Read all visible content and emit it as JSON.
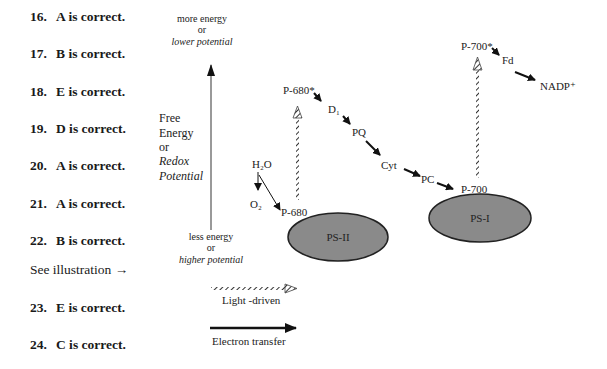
{
  "answers": [
    {
      "num": "16.",
      "text": "A is correct."
    },
    {
      "num": "17.",
      "text": "B is correct."
    },
    {
      "num": "18.",
      "text": "E is correct."
    },
    {
      "num": "19.",
      "text": "D is correct."
    },
    {
      "num": "20.",
      "text": "A is correct."
    },
    {
      "num": "21.",
      "text": "A is correct."
    },
    {
      "num": "22.",
      "text": "B is correct."
    },
    {
      "num": "23.",
      "text": "E is correct."
    },
    {
      "num": "24.",
      "text": "C is correct."
    }
  ],
  "see_illustration": "See illustration →",
  "axis": {
    "top_line1": "more energy",
    "top_line2": "or",
    "top_line3": "lower potential",
    "bottom_line1": "less energy",
    "bottom_line2": "or",
    "bottom_line3": "higher potential",
    "label_line1": "Free",
    "label_line2": "Energy",
    "label_line3": "or",
    "label_line4": "Redox",
    "label_line5": "Potential"
  },
  "nodes": {
    "h2o": "H₂O",
    "o2": "O₂",
    "p680": "P-680",
    "p680_star": "P-680*",
    "d1": "D₁",
    "pq": "PQ",
    "cyt": "Cyt",
    "pc": "PC",
    "p700": "P-700",
    "p700_star": "P-700*",
    "fd": "Fd",
    "nadp": "NADP⁺"
  },
  "photosystems": {
    "ps2": "PS-II",
    "ps1": "PS-I",
    "fill_color": "#8a8a8a",
    "stroke_color": "#222222"
  },
  "legend": {
    "light_driven": "Light -driven",
    "electron_transfer": "Electron transfer"
  }
}
